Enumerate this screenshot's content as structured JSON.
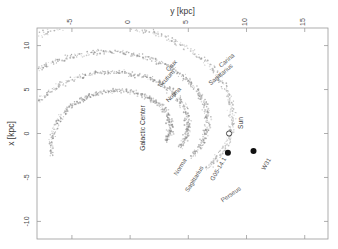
{
  "figure": {
    "orientation": "rotated-90",
    "background": "#ffffff",
    "frame_color": "#9a9a9a"
  },
  "chart_data": {
    "type": "scatter",
    "title": "",
    "xlabel": "y [kpc]",
    "ylabel": "x [kpc]",
    "xlim": [
      -8,
      17
    ],
    "ylim": [
      -12,
      12
    ],
    "grid": false,
    "legend_position": "none",
    "xticks": [
      -5,
      0,
      5,
      10,
      15
    ],
    "xticklabels": [
      "-5",
      "0",
      "5",
      "10",
      "15"
    ],
    "yticks": [
      -10,
      -5,
      0,
      5,
      10
    ],
    "yticklabels": [
      "-10",
      "-5",
      "0",
      "5",
      "10"
    ],
    "series": [
      {
        "name": "Norma",
        "kind": "spiral-arm-point-cloud",
        "label": "Norma",
        "point_color": "#8a8a8a",
        "pitch_deg": 12,
        "r0": 3.4,
        "theta_start": -0.25,
        "theta_end": 3.5,
        "n_points": 420,
        "scatter_kpc": 0.32
      },
      {
        "name": "Crux-Scutum",
        "kind": "spiral-arm-point-cloud",
        "label": "Crux",
        "label2": "Scutum",
        "point_color": "#8a8a8a",
        "pitch_deg": 12,
        "r0": 4.9,
        "theta_start": -0.35,
        "theta_end": 3.7,
        "n_points": 520,
        "scatter_kpc": 0.34
      },
      {
        "name": "Carina-Sagittarius",
        "kind": "spiral-arm-point-cloud",
        "label": "Carina",
        "label2": "Sagittarius",
        "point_color": "#8a8a8a",
        "pitch_deg": 12,
        "r0": 6.5,
        "theta_start": -0.45,
        "theta_end": 3.8,
        "n_points": 600,
        "scatter_kpc": 0.36
      },
      {
        "name": "Perseus",
        "kind": "spiral-arm-point-cloud",
        "label": "Perseus",
        "point_color": "#9a9a9a",
        "pitch_deg": 12,
        "r0": 8.6,
        "theta_start": -0.55,
        "theta_end": 3.4,
        "n_points": 560,
        "scatter_kpc": 0.38
      }
    ],
    "markers": [
      {
        "name": "galactic-center",
        "label": "Galactic Center",
        "x_kpc": 0,
        "y_kpc": 0,
        "style": "none"
      },
      {
        "name": "sun",
        "label": "Sun",
        "x_kpc": 0,
        "y_kpc": 8.5,
        "style": "open-circle",
        "color": "#333333"
      },
      {
        "name": "source-g05",
        "label": "G05-14.1",
        "x_kpc": -2.2,
        "y_kpc": 8.4,
        "style": "filled-circle",
        "color": "#111111"
      },
      {
        "name": "source-w31",
        "label": "W31",
        "x_kpc": -2.0,
        "y_kpc": 10.6,
        "style": "filled-circle",
        "color": "#111111"
      }
    ],
    "annotations": [
      {
        "name": "arm-label-crux",
        "text": "Crux"
      },
      {
        "name": "arm-label-carina",
        "text": "Carina"
      },
      {
        "name": "arm-label-norma",
        "text": "Norma"
      },
      {
        "name": "arm-label-scutum",
        "text": "Scutum"
      },
      {
        "name": "arm-label-sagittarius",
        "text": "Sagittarius"
      },
      {
        "name": "arm-label-perseus",
        "text": "Perseus"
      },
      {
        "name": "center-label",
        "text": "Galactic Center"
      },
      {
        "name": "sun-label",
        "text": "Sun"
      },
      {
        "name": "source-label-g05",
        "text": "G05-14.1"
      },
      {
        "name": "source-label-w31",
        "text": "W31"
      }
    ]
  },
  "axes": {
    "top_title": "y [kpc]",
    "left_title": "x [kpc]",
    "top_ticks": [
      "-5",
      "0",
      "5",
      "10",
      "15"
    ],
    "left_ticks": [
      "-10",
      "-5",
      "0",
      "5",
      "10"
    ]
  }
}
